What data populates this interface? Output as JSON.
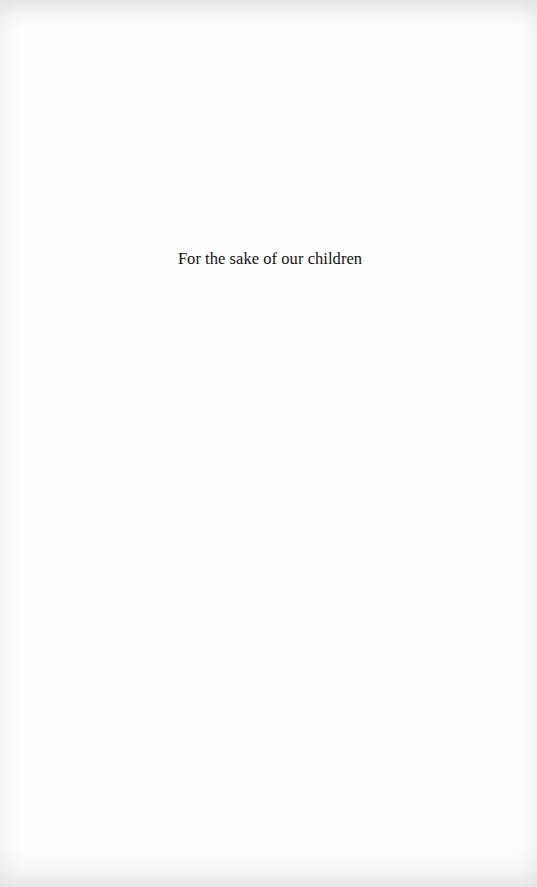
{
  "page": {
    "dedication": "For the sake of our children"
  }
}
